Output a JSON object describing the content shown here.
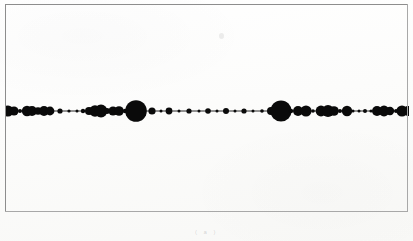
{
  "figure": {
    "background_color": "#fdfdfc",
    "frame_color": "#8d8d8d",
    "ink_color": "#0a0a0a",
    "caption_text": "( a )",
    "caption_top": 229,
    "speck": {
      "x": 219,
      "y": 33
    }
  },
  "frame": {
    "left": 5,
    "top": 4,
    "width": 403,
    "height": 208
  },
  "chart_data": {
    "type": "scatter",
    "title": "",
    "subtitle": "",
    "xlabel": "",
    "ylabel": "",
    "grid": false,
    "legend": "none",
    "axis_line": {
      "y": 110,
      "x_start": 5,
      "x_end": 409,
      "stroke_width": 0.9
    },
    "xlim": [
      5,
      409
    ],
    "ylim": [
      110,
      110
    ],
    "marker_shape": "filled-circle",
    "marker_color": "#0a0a0a",
    "note": "Beads-on-a-string plot: filled black circles of varying radius centred on a single horizontal line. x = position along the line (px), r = marker radius (px).",
    "x": [
      7,
      13,
      19,
      26,
      31,
      37,
      43,
      49,
      59,
      68,
      76,
      82,
      88,
      94,
      100,
      106,
      112,
      118,
      124,
      130,
      135,
      143,
      151,
      160,
      168,
      178,
      188,
      198,
      207,
      216,
      225,
      234,
      243,
      252,
      261,
      270,
      280,
      290,
      297,
      305,
      312,
      320,
      327,
      333,
      339,
      346,
      352,
      358,
      364,
      370,
      376,
      383,
      389,
      395,
      401,
      407
    ],
    "r": [
      5.5,
      4.6,
      2.0,
      5.2,
      5.0,
      3.8,
      5.0,
      4.4,
      2.6,
      1.6,
      1.5,
      2.2,
      4.0,
      5.8,
      6.4,
      3.0,
      4.6,
      4.8,
      2.2,
      2.0,
      10.8,
      1.8,
      3.6,
      1.5,
      3.4,
      1.5,
      2.6,
      1.5,
      2.8,
      1.5,
      3.0,
      1.5,
      2.6,
      1.5,
      1.8,
      4.0,
      10.6,
      2.2,
      5.0,
      5.6,
      1.8,
      5.4,
      6.0,
      4.8,
      2.0,
      5.2,
      1.5,
      1.5,
      2.0,
      1.6,
      5.0,
      5.4,
      4.2,
      2.0,
      5.6,
      5.0
    ],
    "r_min": 1.5,
    "r_max": 10.8,
    "point_count": 55
  }
}
